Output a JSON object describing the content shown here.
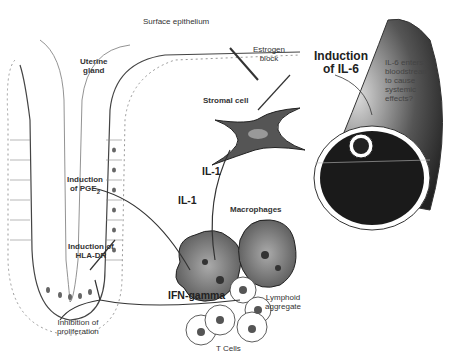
{
  "diagram": {
    "type": "biological-pathway-illustration",
    "labels": {
      "surface_epithelium": "Surface epithelium",
      "uterine_gland": "Uterine\ngland",
      "estrogen_block": "Estrogen\nblock",
      "induction_il6": "Induction\nof IL-6",
      "il6_systemic": "IL-6 enters\nbloodstream\nto cause\nsystemic\neffects?",
      "stromal_cell": "Stromal cell",
      "il1_upper": "IL-1",
      "il1_lower": "IL-1",
      "induction_pge2": "Induction\nof PGE",
      "pge2_subscript": "2",
      "macrophages": "Macrophages",
      "induction_hladr": "Induction of\nHLA-DR",
      "ifn_gamma": "IFN-gamma",
      "lymphoid_aggregate": "Lymphoid\naggregate",
      "inhibition_proliferation": "Inhibition of\nproliferation",
      "t_cells": "T Cells"
    },
    "nodes": [
      {
        "id": "uterine-gland",
        "label": "Uterine gland"
      },
      {
        "id": "surface-epithelium",
        "label": "Surface epithelium"
      },
      {
        "id": "stromal-cell",
        "label": "Stromal cell"
      },
      {
        "id": "macrophages",
        "label": "Macrophages"
      },
      {
        "id": "t-cells",
        "label": "T Cells"
      },
      {
        "id": "lymphoid-aggregate",
        "label": "Lymphoid aggregate"
      },
      {
        "id": "blood-vessel",
        "label": "Bloodstream"
      }
    ],
    "edges": [
      {
        "from": "macrophages",
        "to": "stromal-cell",
        "label": "IL-1"
      },
      {
        "from": "macrophages",
        "to": "uterine-gland",
        "label": "IL-1",
        "effect": "Induction of PGE2"
      },
      {
        "from": "stromal-cell",
        "to": "blood-vessel",
        "label": "Induction of IL-6"
      },
      {
        "from": "estrogen",
        "to": "stromal-cell",
        "label": "Estrogen block"
      },
      {
        "from": "t-cells",
        "to": "uterine-gland",
        "label": "IFN-gamma",
        "effect": "Induction of HLA-DR; Inhibition of proliferation"
      }
    ]
  }
}
